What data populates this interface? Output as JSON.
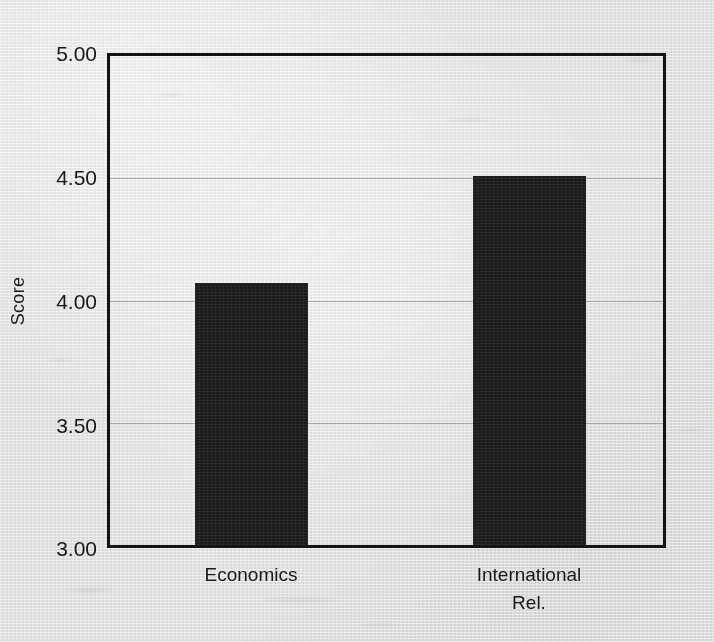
{
  "chart_data": {
    "type": "bar",
    "title": "",
    "subtitle": "",
    "xlabel": "",
    "ylabel": "Score",
    "categories": [
      "Economics",
      "International Rel."
    ],
    "values": [
      4.07,
      4.51
    ],
    "ylim": [
      3.0,
      5.0
    ],
    "yticks": [
      3.0,
      3.5,
      4.0,
      4.5,
      5.0
    ],
    "ytick_labels": [
      "3.00",
      "3.50",
      "4.00",
      "4.50",
      "5.00"
    ],
    "xtick_labels": [
      "Economics",
      "International\nRel."
    ],
    "grid": true,
    "grid_axis": "y",
    "legend": false,
    "legend_position": "none",
    "bar_color": "#1b1b1b",
    "grid_color": "#9a9a9a",
    "axis_color": "#141414",
    "background_color": "#e8e8e7",
    "annotations": []
  }
}
